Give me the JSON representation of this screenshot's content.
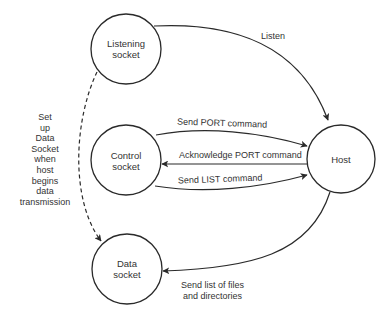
{
  "diagram": {
    "colors": {
      "stroke": "#2a2a2a",
      "text": "#333333",
      "background": "#ffffff"
    },
    "nodes": {
      "listening": {
        "label_line1": "Listening",
        "label_line2": "socket"
      },
      "control": {
        "label_line1": "Control",
        "label_line2": "socket"
      },
      "host": {
        "label": "Host"
      },
      "data": {
        "label_line1": "Data",
        "label_line2": "socket"
      }
    },
    "edges": {
      "listen": {
        "label": "Listen",
        "from": "Listening socket",
        "to": "Host",
        "style": "solid"
      },
      "send_port": {
        "label": "Send PORT command",
        "from": "Control socket",
        "to": "Host",
        "style": "solid"
      },
      "ack_port": {
        "label": "Acknowledge PORT command",
        "from": "Host",
        "to": "Control socket",
        "style": "solid"
      },
      "send_list": {
        "label": "Send LIST command",
        "from": "Control socket",
        "to": "Host",
        "style": "solid"
      },
      "send_files": {
        "label_line1": "Send list of files",
        "label_line2": "and directories",
        "from": "Host",
        "to": "Data socket",
        "style": "solid"
      },
      "setup_data": {
        "from": "Listening socket",
        "to": "Data socket",
        "style": "dashed",
        "label_lines": [
          "Set",
          "up",
          "Data",
          "Socket",
          "when",
          "host",
          "begins",
          "data",
          "transmission"
        ]
      }
    }
  }
}
